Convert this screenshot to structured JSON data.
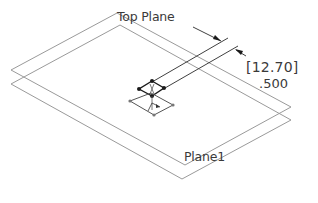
{
  "diagram": {
    "type": "cad-sketch-planes-isometric",
    "planes": [
      {
        "name": "Top Plane",
        "label": "Top Plane"
      },
      {
        "name": "Plane1",
        "label": "Plane1"
      }
    ],
    "dimension": {
      "primary_value": "[12.70]",
      "secondary_value": ".500",
      "primary_unit_hint": "mm",
      "secondary_unit_hint": "in"
    },
    "colors": {
      "plane_edge": "#9a9a9a",
      "dimension_line": "#2a2a2a",
      "text": "#3a3a3a",
      "background": "#ffffff"
    }
  }
}
